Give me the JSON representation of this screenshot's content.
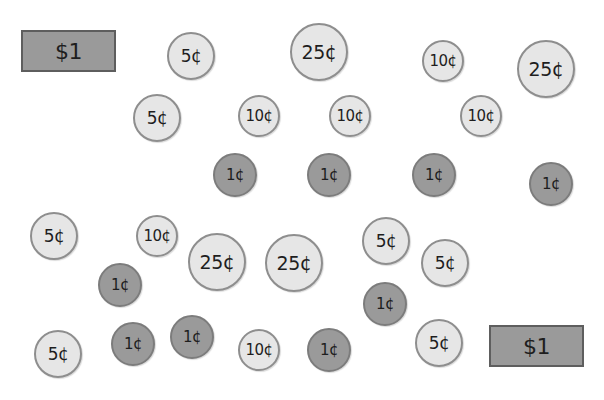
{
  "colors": {
    "background": "#ffffff",
    "light_coin": "#e6e6e6",
    "dark_coin": "#9a9a9a",
    "bill": "#9a9a9a",
    "bill_border": "#5e5e5e"
  },
  "items": [
    {
      "type": "bill",
      "label": "$1",
      "x": 21,
      "y": 30,
      "w": 95,
      "h": 42
    },
    {
      "type": "coin",
      "label": "5¢",
      "x": 191,
      "y": 56,
      "d": 48,
      "shade": "light"
    },
    {
      "type": "coin",
      "label": "25¢",
      "x": 319,
      "y": 52,
      "d": 58,
      "shade": "light"
    },
    {
      "type": "coin",
      "label": "10¢",
      "x": 443,
      "y": 61,
      "d": 42,
      "shade": "light"
    },
    {
      "type": "coin",
      "label": "25¢",
      "x": 546,
      "y": 69,
      "d": 58,
      "shade": "light"
    },
    {
      "type": "coin",
      "label": "5¢",
      "x": 157,
      "y": 118,
      "d": 48,
      "shade": "light"
    },
    {
      "type": "coin",
      "label": "10¢",
      "x": 259,
      "y": 116,
      "d": 42,
      "shade": "light"
    },
    {
      "type": "coin",
      "label": "10¢",
      "x": 350,
      "y": 116,
      "d": 42,
      "shade": "light"
    },
    {
      "type": "coin",
      "label": "10¢",
      "x": 481,
      "y": 116,
      "d": 42,
      "shade": "light"
    },
    {
      "type": "coin",
      "label": "1¢",
      "x": 235,
      "y": 175,
      "d": 44,
      "shade": "dark"
    },
    {
      "type": "coin",
      "label": "1¢",
      "x": 329,
      "y": 175,
      "d": 44,
      "shade": "dark"
    },
    {
      "type": "coin",
      "label": "1¢",
      "x": 434,
      "y": 175,
      "d": 44,
      "shade": "dark"
    },
    {
      "type": "coin",
      "label": "1¢",
      "x": 551,
      "y": 184,
      "d": 44,
      "shade": "dark"
    },
    {
      "type": "coin",
      "label": "5¢",
      "x": 54,
      "y": 236,
      "d": 48,
      "shade": "light"
    },
    {
      "type": "coin",
      "label": "10¢",
      "x": 157,
      "y": 236,
      "d": 42,
      "shade": "light"
    },
    {
      "type": "coin",
      "label": "25¢",
      "x": 217,
      "y": 262,
      "d": 58,
      "shade": "light"
    },
    {
      "type": "coin",
      "label": "25¢",
      "x": 294,
      "y": 263,
      "d": 58,
      "shade": "light"
    },
    {
      "type": "coin",
      "label": "5¢",
      "x": 386,
      "y": 241,
      "d": 48,
      "shade": "light"
    },
    {
      "type": "coin",
      "label": "5¢",
      "x": 445,
      "y": 263,
      "d": 48,
      "shade": "light"
    },
    {
      "type": "coin",
      "label": "1¢",
      "x": 120,
      "y": 285,
      "d": 44,
      "shade": "dark"
    },
    {
      "type": "coin",
      "label": "1¢",
      "x": 385,
      "y": 304,
      "d": 44,
      "shade": "dark"
    },
    {
      "type": "coin",
      "label": "5¢",
      "x": 58,
      "y": 354,
      "d": 48,
      "shade": "light"
    },
    {
      "type": "coin",
      "label": "1¢",
      "x": 133,
      "y": 344,
      "d": 44,
      "shade": "dark"
    },
    {
      "type": "coin",
      "label": "1¢",
      "x": 192,
      "y": 337,
      "d": 44,
      "shade": "dark"
    },
    {
      "type": "coin",
      "label": "10¢",
      "x": 259,
      "y": 350,
      "d": 42,
      "shade": "light"
    },
    {
      "type": "coin",
      "label": "1¢",
      "x": 329,
      "y": 350,
      "d": 44,
      "shade": "dark"
    },
    {
      "type": "coin",
      "label": "5¢",
      "x": 439,
      "y": 343,
      "d": 48,
      "shade": "light"
    },
    {
      "type": "bill",
      "label": "$1",
      "x": 489,
      "y": 325,
      "w": 95,
      "h": 42
    }
  ]
}
